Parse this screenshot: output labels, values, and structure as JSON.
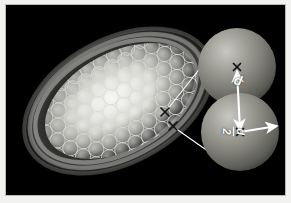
{
  "figure": {
    "background_color": "#000000",
    "frame_color": "#f2f2f0",
    "annotation_color": "#ffffff"
  },
  "galaxy": {
    "name": "tilted-spiral-galaxy",
    "description": "Inclined spiral galaxy disk with bright bulge and outer spiral arm bands",
    "inclination_deg": -28,
    "tile_pattern": "hexagonal",
    "tile_count": 86,
    "tile_outline_color": "#d8d8d8"
  },
  "markers": [
    {
      "name": "pointing-marker-upper",
      "glyph": "x",
      "x": 159,
      "y": 107
    },
    {
      "name": "pointing-marker-lower",
      "glyph": "x",
      "x": 167,
      "y": 121
    }
  ],
  "leader_lines": [
    {
      "name": "leader-line-upper",
      "from_x": 161,
      "to_x": 214,
      "from_y": 105,
      "to_y": 38
    },
    {
      "name": "leader-line-lower",
      "from_x": 169,
      "to_x": 216,
      "from_y": 123,
      "to_y": 156
    }
  ],
  "inset": {
    "name": "magnified-beam-pair",
    "spheres": [
      {
        "name": "sphere-upper",
        "cx": 231,
        "cy": 62,
        "r": 39,
        "center_marker": "x"
      },
      {
        "name": "sphere-lower",
        "cx": 234,
        "cy": 127,
        "r": 39,
        "center_marker": "x"
      }
    ],
    "measurements": [
      {
        "name": "separation-arrow",
        "label": "d",
        "type": "double-headed",
        "meaning": "centre-to-centre separation between adjacent pointings"
      },
      {
        "name": "radius-arrow",
        "label_numerator": "d",
        "label_divider": "/",
        "label_denominator": "2",
        "label": "d/2",
        "type": "single-headed",
        "meaning": "beam radius, half the pointing separation"
      }
    ]
  }
}
